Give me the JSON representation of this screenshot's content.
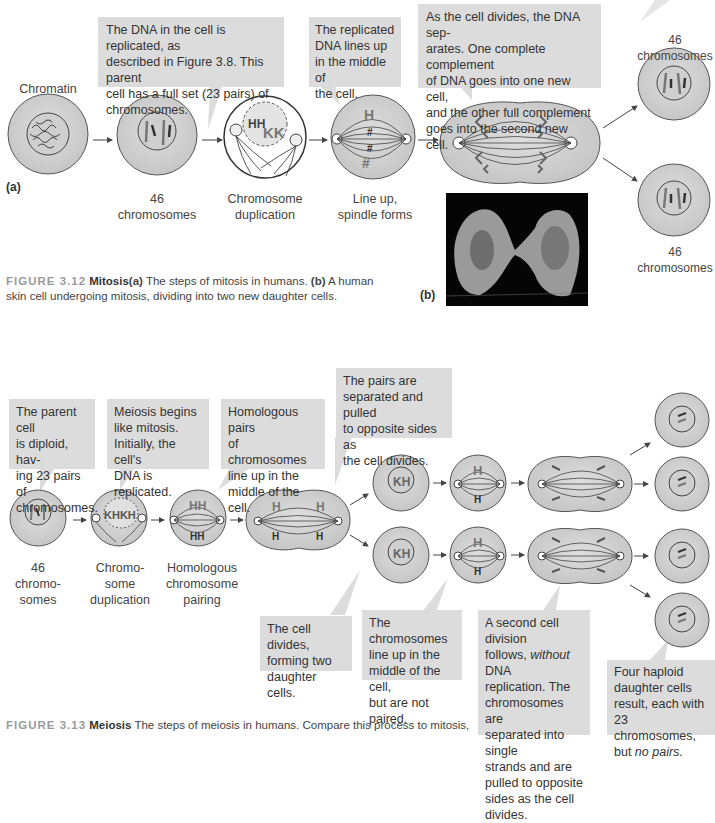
{
  "mitosis": {
    "panel_a_label": "(a)",
    "panel_b_label": "(b)",
    "chromatin_label": "Chromatin",
    "callouts": [
      "The DNA in the cell is replicated, as described in Figure 3.8. This parent cell has a full set (23 pairs) of chromosomes.",
      "The replicated DNA lines up in the middle of the cell.",
      "As the cell divides, the DNA separates. One complete complement of DNA goes into one new cell, and the other full complement goes into the second new cell."
    ],
    "callout_lines": {
      "c1": [
        "The DNA in the cell is replicated, as",
        "described in Figure 3.8. This parent",
        "cell has a full set (23 pairs) of",
        "chromosomes."
      ],
      "c2": [
        "The replicated",
        "DNA lines up",
        "in the middle of",
        "the cell."
      ],
      "c3": [
        "As the cell divides, the DNA sep-",
        "arates. One complete complement",
        "of DNA goes into one new cell,",
        "and the other full complement",
        "goes into the second new cell."
      ]
    },
    "steps": [
      {
        "l1": "46",
        "l2": "chromosomes"
      },
      {
        "l1": "Chromosome",
        "l2": "duplication"
      },
      {
        "l1": "Line up,",
        "l2": "spindle forms"
      }
    ],
    "daughter_label_top": "46 chromosomes",
    "daughter_label_bottom": "46 chromosomes",
    "figure_caption": {
      "number": "FIGURE 3.12",
      "title": "Mitosis",
      "a_marker": "(a)",
      "text_a": " The steps of mitosis in humans. ",
      "b_marker": "(b)",
      "text_b": " A human",
      "line2": "skin cell undergoing mitosis, dividing into two new daughter cells."
    }
  },
  "meiosis": {
    "callouts_top": {
      "c1": [
        "The parent cell",
        "is diploid, hav-",
        "ing 23 pairs of",
        "chromosomes."
      ],
      "c2": [
        "Meiosis begins",
        "like mitosis.",
        "Initially, the cell's",
        "DNA is replicated."
      ],
      "c3": [
        "Homologous pairs",
        "of chromosomes",
        "line up in the",
        "middle of the cell."
      ],
      "c4": [
        "The pairs are",
        "separated and pulled",
        "to opposite sides as",
        "the cell divides."
      ]
    },
    "callouts_bottom": {
      "c5": [
        "The cell divides,",
        "forming two",
        "daughter cells."
      ],
      "c6": [
        "The chromosomes",
        "line up in the",
        "middle of the cell,",
        "but are not paired."
      ],
      "c7_l1": "A second cell division",
      "c7_l2a": "follows, ",
      "c7_l2i": "without",
      "c7_l2b": " DNA",
      "c7_rest": [
        "replication. The",
        "chromosomes are",
        "separated into single",
        "strands and are",
        "pulled to opposite",
        "sides as the cell",
        "divides."
      ],
      "c8": [
        "Four haploid",
        "daughter cells",
        "result, each with",
        "23 chromosomes,"
      ],
      "c8_last_a": "but ",
      "c8_last_i": "no pairs",
      "c8_last_b": "."
    },
    "steps": [
      [
        "46",
        "chromo-",
        "somes"
      ],
      [
        "Chromo-",
        "some",
        "duplication"
      ],
      [
        "Homologous",
        "chromosome",
        "pairing"
      ]
    ],
    "figure_caption": {
      "number": "FIGURE 3.13",
      "title": "Meiosis",
      "text": " The steps of meiosis in humans. Compare this process to mitosis,"
    }
  },
  "colors": {
    "callout_bg": "#dcdcdc",
    "cell_fill": "#cfcfcf",
    "cell_stroke": "#555555",
    "chromosome": "#6e6e6e",
    "figure_number": "#9a9a9a"
  }
}
